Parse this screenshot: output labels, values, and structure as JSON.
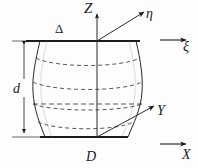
{
  "figure": {
    "type": "geometry-diagram",
    "width": 198,
    "height": 168,
    "background_color": "#fdfdfd",
    "stroke_color": "#1a1a1a",
    "dash_color": "#3a3a3a"
  },
  "axes": [
    {
      "id": "z-axis",
      "label": "Z",
      "kind": "vertical",
      "origin": [
        97,
        137
      ],
      "tip": [
        97,
        12
      ],
      "arrow": true
    },
    {
      "id": "eta-axis",
      "label": "η",
      "kind": "diagonal-up-right",
      "origin": [
        97,
        41
      ],
      "tip": [
        146,
        10
      ],
      "arrow": true
    },
    {
      "id": "y-axis",
      "label": "Y",
      "kind": "diagonal-up-right",
      "origin": [
        97,
        137
      ],
      "tip": [
        156,
        104
      ],
      "arrow": true
    },
    {
      "id": "xi-vector",
      "label": "ξ",
      "kind": "horizontal-free",
      "origin": [
        160,
        40
      ],
      "tip": [
        188,
        40
      ],
      "arrow": true
    },
    {
      "id": "x-vector",
      "label": "X",
      "kind": "horizontal-free",
      "origin": [
        160,
        144
      ],
      "tip": [
        188,
        144
      ],
      "arrow": true
    }
  ],
  "labels": {
    "z": "Z",
    "eta": "η",
    "xi": "ξ",
    "y": "Y",
    "x": "X",
    "delta": "Δ",
    "d_dimension": "d",
    "D_diameter": "D"
  },
  "annotations": [
    {
      "name": "top-rim",
      "description": "Upper circular rim of hyperboloid drawn edge-on as thick line",
      "y": 41,
      "x_start": 26,
      "x_end": 140,
      "label": "Δ"
    },
    {
      "name": "bottom-rim",
      "description": "Lower circular rim of hyperboloid drawn edge-on as thick line",
      "y": 137,
      "x_start": 40,
      "x_end": 128,
      "label": "D"
    },
    {
      "name": "height-dimension",
      "description": "Vertical dimension line with arrowheads marking height d",
      "x": 24,
      "y_top": 41,
      "y_bottom": 137,
      "label": "d"
    }
  ],
  "surface": {
    "name": "hyperboloid-of-one-sheet",
    "left_profile": {
      "top": [
        40,
        41
      ],
      "waist": [
        33,
        92
      ],
      "bottom": [
        45,
        137
      ]
    },
    "right_profile": {
      "top": [
        136,
        41
      ],
      "waist": [
        142,
        92
      ],
      "bottom": [
        128,
        137
      ]
    },
    "cross_sections": [
      {
        "id": "section-1",
        "y": 62,
        "style": "dashed"
      },
      {
        "id": "section-2",
        "y": 85,
        "style": "dashed"
      },
      {
        "id": "section-3",
        "y": 107,
        "style": "dashed"
      },
      {
        "id": "section-4",
        "y": 124,
        "style": "dashed"
      }
    ],
    "generatrix_count": 2
  }
}
